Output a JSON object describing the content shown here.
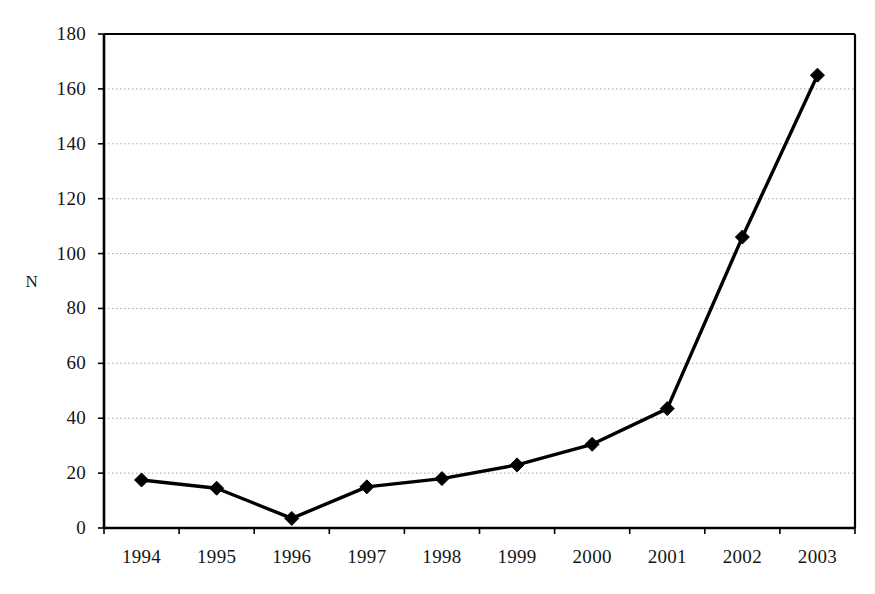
{
  "chart_data": {
    "type": "line",
    "title": "",
    "subtitle": "",
    "xlabel": "",
    "ylabel": "N",
    "categories": [
      "1994",
      "1995",
      "1996",
      "1997",
      "1998",
      "1999",
      "2000",
      "2001",
      "2002",
      "2003"
    ],
    "values": [
      17.5,
      14.5,
      3.5,
      15,
      18,
      23,
      30.5,
      43.5,
      106,
      165
    ],
    "series": [
      {
        "name": "N",
        "values": [
          17.5,
          14.5,
          3.5,
          15,
          18,
          23,
          30.5,
          43.5,
          106,
          165
        ]
      }
    ],
    "ylim": [
      0,
      180
    ],
    "ytick_labels": [
      "0",
      "20",
      "40",
      "60",
      "80",
      "100",
      "120",
      "140",
      "160",
      "180"
    ],
    "ytick_values": [
      0,
      20,
      40,
      60,
      80,
      100,
      120,
      140,
      160,
      180
    ],
    "xtick_labels": [
      "1994",
      "1995",
      "1996",
      "1997",
      "1998",
      "1999",
      "2000",
      "2001",
      "2002",
      "2003"
    ],
    "grid": true,
    "grid_style": "dotted-horizontal",
    "legend": false,
    "legend_position": "none",
    "marker": "diamond",
    "line_color": "#000000",
    "marker_color": "#000000",
    "grid_color": "#999999",
    "axis_color": "#000000",
    "background_color": "#ffffff"
  }
}
